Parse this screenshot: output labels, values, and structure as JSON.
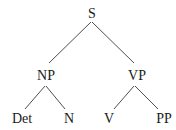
{
  "diagram": {
    "type": "syntax-tree",
    "nodes": [
      {
        "id": "S",
        "label": "S",
        "x": 92,
        "y": 18
      },
      {
        "id": "NP",
        "label": "NP",
        "x": 46,
        "y": 80
      },
      {
        "id": "VP",
        "label": "VP",
        "x": 137,
        "y": 80
      },
      {
        "id": "Det",
        "label": "Det",
        "x": 22,
        "y": 123
      },
      {
        "id": "N",
        "label": "N",
        "x": 69,
        "y": 123
      },
      {
        "id": "V",
        "label": "V",
        "x": 109,
        "y": 123
      },
      {
        "id": "PP",
        "label": "PP",
        "x": 164,
        "y": 123
      }
    ],
    "edges": [
      {
        "from": "S",
        "to": "NP",
        "x1": 91,
        "y1": 22,
        "x2": 49,
        "y2": 63
      },
      {
        "from": "S",
        "to": "VP",
        "x1": 92,
        "y1": 22,
        "x2": 134,
        "y2": 63
      },
      {
        "from": "NP",
        "to": "Det",
        "x1": 45,
        "y1": 86,
        "x2": 25,
        "y2": 109
      },
      {
        "from": "NP",
        "to": "N",
        "x1": 46,
        "y1": 86,
        "x2": 65,
        "y2": 109
      },
      {
        "from": "VP",
        "to": "V",
        "x1": 134,
        "y1": 86,
        "x2": 114,
        "y2": 109
      },
      {
        "from": "VP",
        "to": "PP",
        "x1": 135,
        "y1": 86,
        "x2": 158,
        "y2": 109
      }
    ]
  }
}
